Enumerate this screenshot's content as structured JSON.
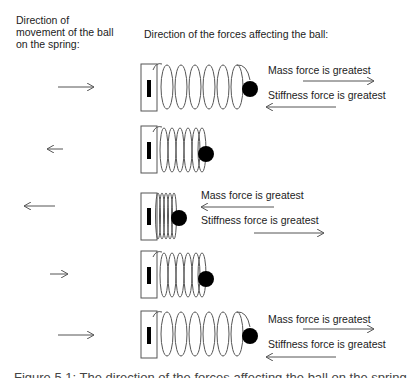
{
  "headers": {
    "left": "Direction of movement of the ball on the spring:",
    "right": "Direction of the forces affecting the ball:"
  },
  "rows": [
    {
      "movement": "right",
      "spring": "extended",
      "labels": [
        {
          "text": "Mass force is greatest",
          "arrow": "right"
        },
        {
          "text": "Stiffness force is greatest",
          "arrow": "left"
        }
      ]
    },
    {
      "movement": "left",
      "spring": "medium",
      "labels": []
    },
    {
      "movement": "left",
      "spring": "compressed",
      "labels": [
        {
          "text": "Mass force is greatest",
          "arrow": "left"
        },
        {
          "text": "Stiffness force is greatest",
          "arrow": "right"
        }
      ]
    },
    {
      "movement": "right",
      "spring": "medium",
      "labels": []
    },
    {
      "movement": "right",
      "spring": "extended",
      "labels": [
        {
          "text": "Mass force is greatest",
          "arrow": "right"
        },
        {
          "text": "Stiffness force is greatest",
          "arrow": "left"
        }
      ]
    }
  ],
  "caption": "Figure 5.1: The direction of the forces affecting the ball on the spring",
  "colors": {
    "line": "#555555",
    "ball": "#000000",
    "text": "#222222"
  }
}
